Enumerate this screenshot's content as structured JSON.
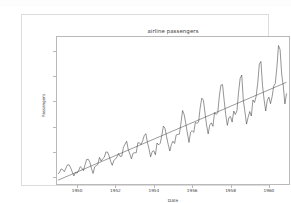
{
  "figure": {
    "title": "airline passengers",
    "background_color": "#ffffff",
    "border_color": "#dcdcdc",
    "axes_border_color": "#b9b9b9",
    "series_color": "#3d3d3d",
    "trend_color": "#4a4a4a"
  },
  "chart_data": {
    "type": "line",
    "title": "airline passengers",
    "xlabel": "Date",
    "ylabel": "Passengers",
    "xlim": [
      1948.9,
      1961.1
    ],
    "ylim": [
      68,
      660
    ],
    "grid": false,
    "legend": "none",
    "xticks": [
      "1950",
      "1952",
      "1954",
      "1956",
      "1958",
      "1960"
    ],
    "xtick_values": [
      1950,
      1952,
      1954,
      1956,
      1958,
      1960
    ],
    "yticks": [
      "100",
      "200",
      "300",
      "400",
      "500",
      "600"
    ],
    "ytick_values": [
      100,
      200,
      300,
      400,
      500,
      600
    ],
    "x_start": 1949.0,
    "x_step": 0.0833333,
    "series": [
      {
        "name": "Passengers",
        "kind": "observed",
        "values": [
          112,
          118,
          132,
          129,
          121,
          135,
          148,
          148,
          136,
          119,
          104,
          118,
          115,
          126,
          141,
          135,
          125,
          149,
          170,
          170,
          158,
          133,
          114,
          140,
          145,
          150,
          178,
          163,
          172,
          178,
          199,
          199,
          184,
          162,
          146,
          166,
          171,
          180,
          193,
          181,
          183,
          218,
          230,
          242,
          209,
          191,
          172,
          194,
          196,
          196,
          236,
          235,
          229,
          243,
          264,
          272,
          237,
          211,
          180,
          201,
          204,
          188,
          235,
          227,
          234,
          264,
          302,
          293,
          259,
          229,
          203,
          229,
          242,
          233,
          267,
          269,
          270,
          315,
          364,
          347,
          312,
          274,
          237,
          278,
          284,
          277,
          317,
          313,
          318,
          374,
          413,
          405,
          355,
          306,
          271,
          306,
          315,
          301,
          356,
          348,
          355,
          422,
          465,
          467,
          404,
          347,
          305,
          336,
          340,
          318,
          362,
          348,
          363,
          435,
          491,
          505,
          404,
          359,
          310,
          337,
          360,
          342,
          406,
          396,
          420,
          472,
          548,
          559,
          463,
          407,
          362,
          405,
          417,
          391,
          419,
          461,
          472,
          535,
          622,
          606,
          508,
          461,
          390,
          432
        ]
      },
      {
        "name": "Linear trend",
        "kind": "trend",
        "x": [
          1949.0,
          1960.917
        ],
        "values": [
          87,
          476
        ]
      }
    ]
  }
}
